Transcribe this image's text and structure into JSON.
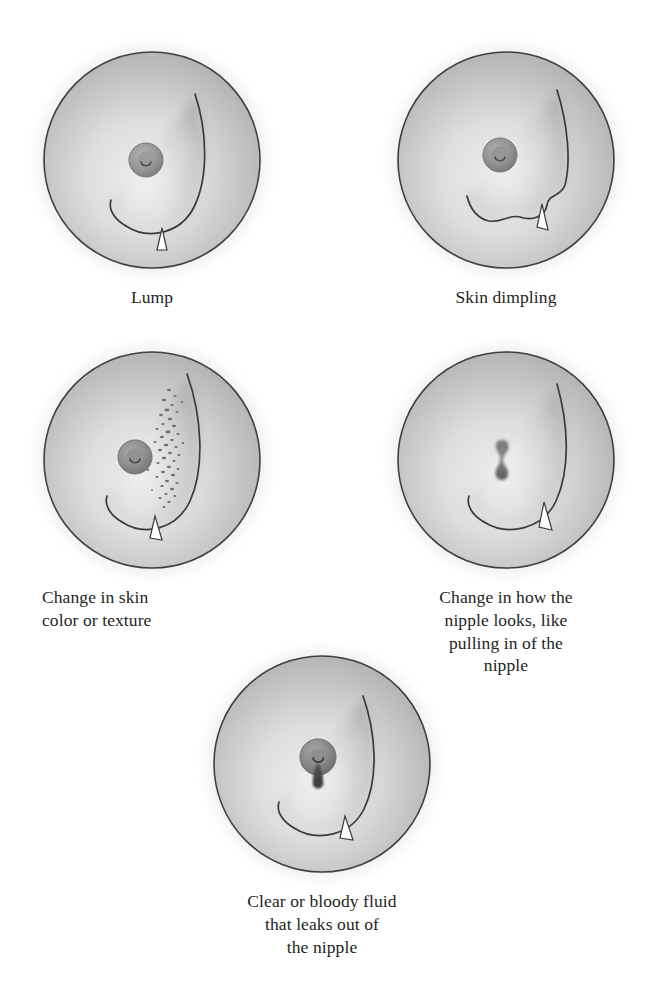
{
  "figure": {
    "style": "grayscale medical line illustration",
    "panel_count": 5,
    "layout": "two columns of two panels, one centered panel below",
    "colors": {
      "background": "#ffffff",
      "skin_light": "#e9e9e9",
      "skin_mid": "#c9c9c9",
      "skin_shadow": "#a8a8a8",
      "outline": "#3a3a3a",
      "nipple": "#8d8d8d",
      "nipple_dark": "#6a6a6a",
      "caption_text": "#231f20",
      "fluid": "#4a4a4a"
    }
  },
  "panels": [
    {
      "id": "lump",
      "caption": "Lump",
      "caption_align": "center",
      "feature": "a rounded bulge on the lower breast contour indicating a lump",
      "position": "top-left"
    },
    {
      "id": "skin-dimpling",
      "caption": "Skin dimpling",
      "caption_align": "center",
      "feature": "an irregular notched and puckered breast contour indicating dimpled skin",
      "position": "top-right"
    },
    {
      "id": "skin-change",
      "caption": "Change in skin\ncolor or texture",
      "caption_align": "left",
      "feature": "a vertical band of dark stippled speckles on the outer breast indicating changed skin texture",
      "position": "middle-left"
    },
    {
      "id": "nipple-change",
      "caption": "Change in how the\nnipple looks, like\npulling in of the\nnipple",
      "caption_align": "center",
      "feature": "the nipple drawn as a dark vertical hourglass slit indicating an inverted or retracted nipple",
      "position": "middle-right"
    },
    {
      "id": "nipple-discharge",
      "caption": "Clear or bloody fluid\nthat leaks out of\nthe nipple",
      "caption_align": "center",
      "feature": "a dark teardrop of fluid hanging below the nipple indicating discharge",
      "position": "bottom-center"
    }
  ]
}
